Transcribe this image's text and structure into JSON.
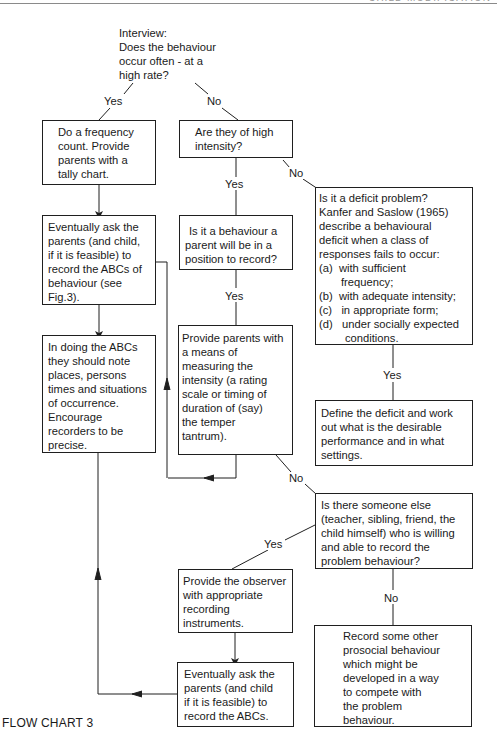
{
  "page_header": {
    "text": "CHILD MODIFICATION",
    "partially_visible": true
  },
  "caption": "FLOW CHART 3",
  "start": {
    "lines": [
      "Interview:",
      "Does the behaviour",
      "occur often - at a",
      "high rate?"
    ]
  },
  "edge_labels": {
    "start_yes": "Yes",
    "start_no": "No",
    "intensity_yes": "Yes",
    "intensity_no": "No",
    "position_yes": "Yes",
    "deficit_yes": "Yes",
    "means_no": "No",
    "someone_yes": "Yes",
    "someone_no": "No"
  },
  "nodes": {
    "frequency_count": {
      "lines": [
        "Do a frequency",
        "count.  Provide",
        "parents with a",
        "tally chart."
      ]
    },
    "high_intensity": {
      "lines": [
        "Are they of high",
        "intensity?"
      ]
    },
    "ask_parents_abc": {
      "lines": [
        "Eventually ask the",
        "parents (and child,",
        "if it is feasible) to",
        "record the ABCs of",
        "behaviour (see",
        "Fig.3)."
      ]
    },
    "parent_position": {
      "lines": [
        "Is it a behaviour a",
        "parent will be in a",
        "position to record?"
      ]
    },
    "deficit_problem": {
      "lines": [
        "Is it a deficit problem?",
        "Kanfer and Saslow (1965)",
        "describe a behavioural",
        "deficit when a class of",
        "responses fails to occur:"
      ],
      "items": [
        {
          "marker": "(a)",
          "text": "with sufficient",
          "cont": "frequency;"
        },
        {
          "marker": "(b)",
          "text": "with adequate intensity;"
        },
        {
          "marker": "(c)",
          "text": "in appropriate form;"
        },
        {
          "marker": "(d)",
          "text": "under socially expected",
          "cont": "conditions."
        }
      ]
    },
    "doing_abcs": {
      "lines": [
        "In doing the ABCs",
        "they should note",
        "places, persons",
        "times and situations",
        "of occurrence.",
        "Encourage",
        "recorders to be",
        "precise."
      ]
    },
    "measure_intensity": {
      "lines": [
        "Provide parents with",
        "a means of",
        "measuring the",
        "intensity (a rating",
        "scale or timing of",
        "duration of (say)",
        "the temper",
        "tantrum)."
      ]
    },
    "define_deficit": {
      "lines": [
        "Define the deficit and work",
        "out what is the desirable",
        "performance and in what",
        "settings."
      ]
    },
    "someone_else": {
      "lines": [
        "Is there someone else",
        "(teacher, sibling, friend, the",
        "child himself) who is willing",
        "and able to record the",
        "problem behaviour?"
      ]
    },
    "provide_observer": {
      "lines": [
        "Provide the observer",
        "with appropriate",
        "recording",
        "instruments."
      ]
    },
    "ask_parents_abc_2": {
      "lines": [
        "Eventually ask the",
        "parents (and child",
        "if it is feasible) to",
        "record the ABCs."
      ]
    },
    "prosocial": {
      "lines": [
        "Record some other",
        "prosocial behaviour",
        "which might be",
        "developed in a way",
        "to  compete with",
        "the problem",
        "behaviour."
      ]
    }
  },
  "colors": {
    "ink": "#1f1f1f",
    "paper": "#ffffff",
    "header_rule": "#8a8a8a"
  }
}
